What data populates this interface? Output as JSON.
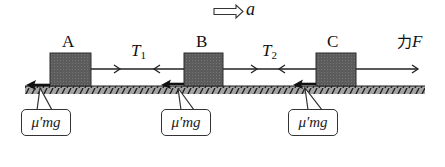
{
  "diagram": {
    "acceleration": {
      "label": "a",
      "arrow": "double-outline-arrow-right"
    },
    "blocks": [
      {
        "id": "A",
        "label": "A"
      },
      {
        "id": "B",
        "label": "B"
      },
      {
        "id": "C",
        "label": "C"
      }
    ],
    "tensions": [
      {
        "id": "T1",
        "symbol": "T",
        "subscript": "1"
      },
      {
        "id": "T2",
        "symbol": "T",
        "subscript": "2"
      }
    ],
    "applied_force": {
      "prefix": "力",
      "symbol": "F"
    },
    "friction_labels": [
      {
        "block": "A",
        "text": "μ′mg"
      },
      {
        "block": "B",
        "text": "μ′mg"
      },
      {
        "block": "C",
        "text": "μ′mg"
      }
    ],
    "colors": {
      "block_fill": "#5f5f5f",
      "block_stroke": "#2a2a2a",
      "ground_fill": "#9a9a9a",
      "ground_hatch": "#222222",
      "line": "#222222",
      "friction_arrow": "#111111"
    }
  }
}
